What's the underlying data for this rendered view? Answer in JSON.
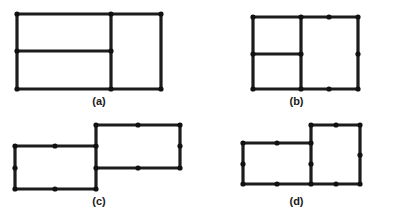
{
  "figure": {
    "background_color": "#ffffff",
    "stroke_color": "#1c1c1c",
    "node_color": "#111111",
    "stroke_width": 3.2,
    "node_radius": 2.6,
    "width": 395,
    "height": 222,
    "caption_color": "#1a1a1a",
    "panels": [
      {
        "id": "panel-a",
        "caption": "(a)",
        "description": "Large rectangle divided by one vertical edge near the right and one horizontal edge in the left portion",
        "viewbox": "0 0 198 100",
        "origin_x": 0,
        "origin_y": 0,
        "cell_width": 198,
        "cell_height": 111,
        "caption_y": 95,
        "edges": [
          {
            "name": "outer-top",
            "x1": 17,
            "y1": 14,
            "x2": 161,
            "y2": 14
          },
          {
            "name": "outer-bottom",
            "x1": 17,
            "y1": 89,
            "x2": 161,
            "y2": 89
          },
          {
            "name": "outer-left",
            "x1": 17,
            "y1": 14,
            "x2": 17,
            "y2": 89
          },
          {
            "name": "outer-right",
            "x1": 161,
            "y1": 14,
            "x2": 161,
            "y2": 89
          },
          {
            "name": "inner-vertical-divider",
            "x1": 111,
            "y1": 14,
            "x2": 111,
            "y2": 89
          },
          {
            "name": "inner-horizontal-divider",
            "x1": 17,
            "y1": 51,
            "x2": 111,
            "y2": 51
          }
        ],
        "nodes": [
          {
            "name": "node-top-left",
            "x": 17,
            "y": 14
          },
          {
            "name": "node-top-divider",
            "x": 111,
            "y": 14
          },
          {
            "name": "node-top-right",
            "x": 161,
            "y": 14
          },
          {
            "name": "node-mid-left",
            "x": 17,
            "y": 51
          },
          {
            "name": "node-mid-divider",
            "x": 111,
            "y": 51
          },
          {
            "name": "node-bottom-left",
            "x": 17,
            "y": 89
          },
          {
            "name": "node-bottom-divider",
            "x": 111,
            "y": 89
          },
          {
            "name": "node-bottom-right",
            "x": 161,
            "y": 89
          }
        ]
      },
      {
        "id": "panel-b",
        "caption": "(b)",
        "description": "Large rectangle divided by a vertical edge left of center and a horizontal edge in the left portion, with midpoint nodes on the right region edges",
        "viewbox": "0 0 197 100",
        "origin_x": 198,
        "origin_y": 0,
        "cell_width": 197,
        "cell_height": 111,
        "caption_y": 95,
        "edges": [
          {
            "name": "outer-top",
            "x1": 55,
            "y1": 17,
            "x2": 160,
            "y2": 17
          },
          {
            "name": "outer-bottom",
            "x1": 55,
            "y1": 89,
            "x2": 160,
            "y2": 89
          },
          {
            "name": "outer-left",
            "x1": 55,
            "y1": 17,
            "x2": 55,
            "y2": 89
          },
          {
            "name": "outer-right",
            "x1": 160,
            "y1": 17,
            "x2": 160,
            "y2": 89
          },
          {
            "name": "inner-vertical-divider",
            "x1": 103,
            "y1": 17,
            "x2": 103,
            "y2": 89
          },
          {
            "name": "inner-horizontal-divider",
            "x1": 55,
            "y1": 54,
            "x2": 103,
            "y2": 54
          }
        ],
        "nodes": [
          {
            "name": "node-top-left",
            "x": 55,
            "y": 17
          },
          {
            "name": "node-top-divider",
            "x": 103,
            "y": 17
          },
          {
            "name": "node-top-right-midpoint",
            "x": 131,
            "y": 17
          },
          {
            "name": "node-top-right",
            "x": 160,
            "y": 17
          },
          {
            "name": "node-mid-left",
            "x": 55,
            "y": 54
          },
          {
            "name": "node-mid-divider",
            "x": 103,
            "y": 54
          },
          {
            "name": "node-right-midpoint",
            "x": 160,
            "y": 54
          },
          {
            "name": "node-bottom-left",
            "x": 55,
            "y": 89
          },
          {
            "name": "node-bottom-divider",
            "x": 103,
            "y": 89
          },
          {
            "name": "node-bottom-right-midpoint",
            "x": 131,
            "y": 89
          },
          {
            "name": "node-bottom-right",
            "x": 160,
            "y": 89
          }
        ]
      },
      {
        "id": "panel-c",
        "caption": "(c)",
        "description": "Two rectangles of equal width joined at a shared vertical edge, the right rectangle offset upward",
        "viewbox": "0 0 198 100",
        "origin_x": 0,
        "origin_y": 111,
        "cell_width": 198,
        "cell_height": 111,
        "caption_y": 84,
        "edges": [
          {
            "name": "left-rect-top",
            "x1": 15,
            "y1": 35,
            "x2": 96,
            "y2": 35
          },
          {
            "name": "left-rect-bottom",
            "x1": 15,
            "y1": 78,
            "x2": 96,
            "y2": 78
          },
          {
            "name": "left-rect-left",
            "x1": 15,
            "y1": 35,
            "x2": 15,
            "y2": 78
          },
          {
            "name": "shared-vertical-edge",
            "x1": 96,
            "y1": 14,
            "x2": 96,
            "y2": 78
          },
          {
            "name": "right-rect-top",
            "x1": 96,
            "y1": 14,
            "x2": 180,
            "y2": 14
          },
          {
            "name": "right-rect-bottom",
            "x1": 96,
            "y1": 57,
            "x2": 180,
            "y2": 57
          },
          {
            "name": "right-rect-right",
            "x1": 180,
            "y1": 14,
            "x2": 180,
            "y2": 57
          }
        ],
        "nodes": [
          {
            "name": "node-left-top-left",
            "x": 15,
            "y": 35
          },
          {
            "name": "node-left-top-midpoint",
            "x": 55,
            "y": 35
          },
          {
            "name": "node-left-left-midpoint",
            "x": 15,
            "y": 57
          },
          {
            "name": "node-left-bottom-left",
            "x": 15,
            "y": 78
          },
          {
            "name": "node-left-bottom-midpoint",
            "x": 55,
            "y": 78
          },
          {
            "name": "node-junction-top",
            "x": 96,
            "y": 35
          },
          {
            "name": "node-junction-bottom",
            "x": 96,
            "y": 78
          },
          {
            "name": "node-right-top-left",
            "x": 96,
            "y": 14
          },
          {
            "name": "node-right-top-midpoint",
            "x": 138,
            "y": 14
          },
          {
            "name": "node-right-top-right",
            "x": 180,
            "y": 14
          },
          {
            "name": "node-right-right-midpoint",
            "x": 180,
            "y": 35
          },
          {
            "name": "node-right-bottom-left",
            "x": 96,
            "y": 57
          },
          {
            "name": "node-right-bottom-midpoint",
            "x": 138,
            "y": 57
          },
          {
            "name": "node-right-bottom-right",
            "x": 180,
            "y": 57
          }
        ]
      },
      {
        "id": "panel-d",
        "caption": "(d)",
        "description": "A wide rectangle and a narrower square joined at a shared vertical edge, the right square offset upward",
        "viewbox": "0 0 197 100",
        "origin_x": 198,
        "origin_y": 111,
        "cell_width": 197,
        "cell_height": 111,
        "caption_y": 84,
        "edges": [
          {
            "name": "left-rect-top",
            "x1": 45,
            "y1": 32,
            "x2": 113,
            "y2": 32
          },
          {
            "name": "left-rect-bottom",
            "x1": 45,
            "y1": 73,
            "x2": 113,
            "y2": 73
          },
          {
            "name": "left-rect-left",
            "x1": 45,
            "y1": 32,
            "x2": 45,
            "y2": 73
          },
          {
            "name": "shared-vertical-edge",
            "x1": 113,
            "y1": 14,
            "x2": 113,
            "y2": 73
          },
          {
            "name": "right-rect-top",
            "x1": 113,
            "y1": 14,
            "x2": 162,
            "y2": 14
          },
          {
            "name": "right-rect-bottom",
            "x1": 113,
            "y1": 73,
            "x2": 162,
            "y2": 73
          },
          {
            "name": "right-rect-right",
            "x1": 162,
            "y1": 14,
            "x2": 162,
            "y2": 73
          }
        ],
        "nodes": [
          {
            "name": "node-left-top-left",
            "x": 45,
            "y": 32
          },
          {
            "name": "node-left-top-midpoint",
            "x": 79,
            "y": 32
          },
          {
            "name": "node-left-left-midpoint",
            "x": 45,
            "y": 53
          },
          {
            "name": "node-left-bottom-left",
            "x": 45,
            "y": 73
          },
          {
            "name": "node-left-bottom-midpoint",
            "x": 79,
            "y": 73
          },
          {
            "name": "node-junction-top",
            "x": 113,
            "y": 32
          },
          {
            "name": "node-junction-bottom",
            "x": 113,
            "y": 73
          },
          {
            "name": "node-right-top-left",
            "x": 113,
            "y": 14
          },
          {
            "name": "node-right-top-midpoint",
            "x": 138,
            "y": 14
          },
          {
            "name": "node-right-top-right",
            "x": 162,
            "y": 14
          },
          {
            "name": "node-right-right-midpoint",
            "x": 162,
            "y": 44
          },
          {
            "name": "node-right-bottom-midpoint",
            "x": 138,
            "y": 73
          },
          {
            "name": "node-right-bottom-right",
            "x": 162,
            "y": 73
          },
          {
            "name": "node-junction-mid",
            "x": 113,
            "y": 53
          }
        ]
      }
    ]
  }
}
